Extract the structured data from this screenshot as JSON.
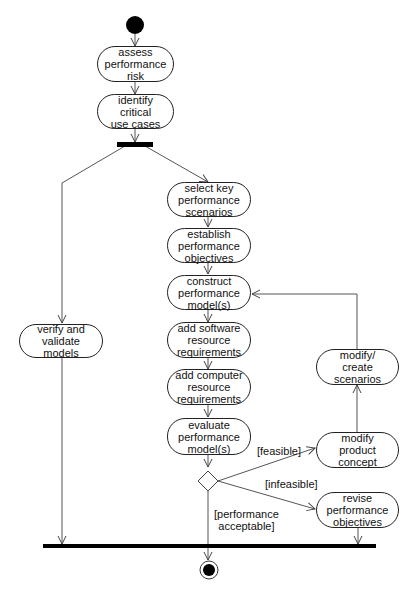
{
  "diagram": {
    "type": "UML activity diagram",
    "activities": {
      "assess_risk": "assess\nperformance\nrisk",
      "identify_use_cases": "identify\ncritical\nuse cases",
      "select_scenarios": "select key\nperformance\nscenarios",
      "establish_objectives": "establish\nperformance\nobjectives",
      "construct_models": "construct\nperformance\nmodel(s)",
      "add_software": "add software\nresource\nrequirements",
      "add_computer": "add computer\nresource\nrequirements",
      "evaluate_models": "evaluate\nperformance\nmodel(s)",
      "verify_validate": "verify and\nvalidate\nmodels",
      "modify_create_scenarios": "modify/\ncreate\nscenarios",
      "modify_product_concept": "modify\nproduct\nconcept",
      "revise_objectives": "revise\nperformance\nobjectives"
    },
    "guards": {
      "feasible": "[feasible]",
      "infeasible": "[infeasible]",
      "acceptable": "[performance\nacceptable]"
    },
    "colors": {
      "line": "#555555",
      "bar": "#000000",
      "node_border": "#222222"
    }
  }
}
